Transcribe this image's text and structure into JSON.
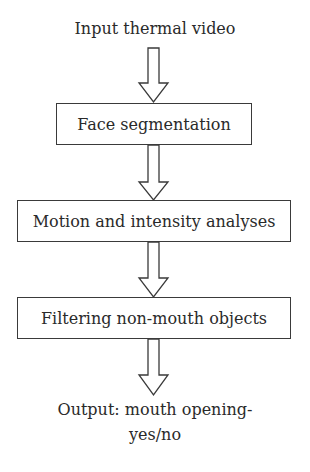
{
  "diagram": {
    "type": "flowchart",
    "direction": "top-to-bottom",
    "input_label": "Input thermal video",
    "steps": [
      {
        "label": "Face segmentation"
      },
      {
        "label": "Motion and intensity analyses"
      },
      {
        "label": "Filtering non-mouth objects"
      }
    ],
    "output_label_line1": "Output: mouth opening-",
    "output_label_line2": "yes/no",
    "arrows": [
      {
        "from": "Input thermal video",
        "to": "Face segmentation",
        "style": "hollow-block-arrow"
      },
      {
        "from": "Face segmentation",
        "to": "Motion and intensity analyses",
        "style": "hollow-block-arrow"
      },
      {
        "from": "Motion and intensity analyses",
        "to": "Filtering non-mouth objects",
        "style": "hollow-block-arrow"
      },
      {
        "from": "Filtering non-mouth objects",
        "to": "Output: mouth opening-yes/no",
        "style": "hollow-block-arrow"
      }
    ],
    "colors": {
      "stroke": "#3a3a3a",
      "text": "#2a2a2a",
      "background": "#ffffff"
    }
  }
}
